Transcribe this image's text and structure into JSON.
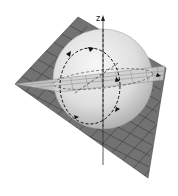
{
  "figure": {
    "axis_label": "z",
    "colors": {
      "background": "#ffffff",
      "dark_plane": "#6e6e6e",
      "dark_plane_grid": "#3c3c3c",
      "light_plane": "#c8c8c8",
      "light_plane_grid": "#8a8a8a",
      "sphere_light": "#f4f4f4",
      "sphere_dark": "#b4b4b4",
      "axis": "#333333",
      "dashed": "#1a1a1a"
    }
  }
}
